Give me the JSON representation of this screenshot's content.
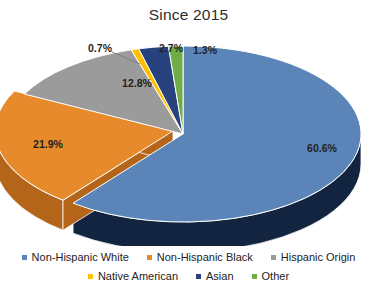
{
  "chart": {
    "title": "Since 2015"
  },
  "chart_data": {
    "type": "pie",
    "title": "Since 2015",
    "xlabel": "",
    "ylabel": "",
    "legend_position": "bottom",
    "grid": false,
    "three_d": true,
    "categories": [
      "Non-Hispanic White",
      "Non-Hispanic Black",
      "Hispanic Origin",
      "Native American",
      "Asian",
      "Other"
    ],
    "values": [
      60.6,
      21.9,
      12.8,
      0.7,
      2.7,
      1.3
    ],
    "data_labels": [
      "60.6%",
      "21.9%",
      "12.8%",
      "0.7%",
      "2.7%",
      "1.3%"
    ],
    "colors": [
      "#5b85b8",
      "#e78a2b",
      "#9b9b9b",
      "#ffc000",
      "#27427c",
      "#70ad47"
    ],
    "side_colors": [
      "#12243f",
      "#b5651a",
      "#6f6f6f",
      "#c08f00",
      "#17294e",
      "#4e7d30"
    ]
  },
  "legend": {
    "rows": [
      [
        {
          "label": "Non-Hispanic White",
          "color": "#5b85b8"
        },
        {
          "label": "Non-Hispanic Black",
          "color": "#e78a2b"
        },
        {
          "label": "Hispanic Origin",
          "color": "#9b9b9b"
        }
      ],
      [
        {
          "label": "Native American",
          "color": "#ffc000"
        },
        {
          "label": "Asian",
          "color": "#27427c"
        },
        {
          "label": "Other",
          "color": "#70ad47"
        }
      ]
    ]
  }
}
